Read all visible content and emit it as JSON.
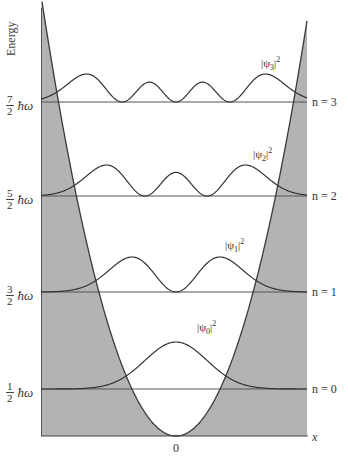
{
  "figure": {
    "y_axis_label": "Energy",
    "x_axis_label": "x",
    "origin_label": "0",
    "hbar_omega": "ħω",
    "levels": [
      {
        "n": 0,
        "num": "1",
        "den": "2",
        "n_label": "n = 0",
        "psi_label_sub": "0",
        "y": 389
      },
      {
        "n": 1,
        "num": "3",
        "den": "2",
        "n_label": "n = 1",
        "psi_label_sub": "1",
        "y": 292
      },
      {
        "n": 2,
        "num": "5",
        "den": "2",
        "n_label": "n = 2",
        "psi_label_sub": "2",
        "y": 196
      },
      {
        "n": 3,
        "num": "7",
        "den": "2",
        "n_label": "n = 3",
        "psi_label_sub": "3",
        "y": 102
      }
    ],
    "colors": {
      "shade": "#b3b3b3",
      "line": "#3a3a3a",
      "background": "#ffffff"
    }
  },
  "chart_data": {
    "type": "line",
    "title": "",
    "xlabel": "x",
    "ylabel": "Energy",
    "y_ticks": [
      "1/2 ħω",
      "3/2 ħω",
      "5/2 ħω",
      "7/2 ħω"
    ],
    "x_ticks": [
      "0"
    ],
    "series": [
      {
        "name": "potential V(x)",
        "shape": "parabola"
      },
      {
        "name": "|ψ0|^2",
        "level": "n = 0",
        "energy": 0.5,
        "nodes": 0,
        "peaks": 1
      },
      {
        "name": "|ψ1|^2",
        "level": "n = 1",
        "energy": 1.5,
        "nodes": 1,
        "peaks": 2
      },
      {
        "name": "|ψ2|^2",
        "level": "n = 2",
        "energy": 2.5,
        "nodes": 2,
        "peaks": 3
      },
      {
        "name": "|ψ3|^2",
        "level": "n = 3",
        "energy": 3.5,
        "nodes": 3,
        "peaks": 4
      }
    ],
    "grid": false,
    "legend": "none"
  }
}
